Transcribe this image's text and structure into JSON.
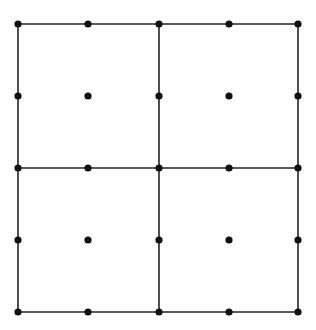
{
  "diagram": {
    "title": "",
    "colors": {
      "background": "#ffffff",
      "line": "#222222",
      "dot": "#111111"
    },
    "grid": {
      "rows": 2,
      "cols": 2
    },
    "x_lines": [
      18,
      159,
      298
    ],
    "y_lines": [
      24,
      168,
      312
    ],
    "dot_x": [
      18,
      88,
      159,
      229,
      298
    ],
    "dot_y": [
      24,
      96,
      168,
      240,
      312
    ],
    "dot_radius": 3.6,
    "line_width": 1.6
  }
}
